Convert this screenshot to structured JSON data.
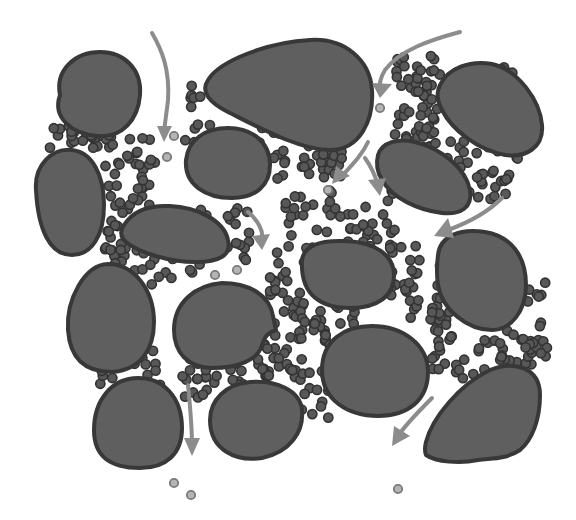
{
  "diagram": {
    "colors": {
      "background": "#ffffff",
      "grain_fill": "#5f5f5f",
      "grain_stroke": "#383838",
      "clay_fill": "#585858",
      "clay_stroke": "#333333",
      "fine_fill": "#b4b4b4",
      "fine_stroke": "#7a7a7a",
      "arrow": "#8c8c8c"
    },
    "grains": [
      {
        "d": "M60 95 C55 70 75 52 100 52 C125 52 142 70 140 95 C138 120 122 138 98 136 C72 134 52 118 60 95 Z"
      },
      {
        "d": "M208 80 C220 60 270 42 310 40 C345 38 370 60 372 90 C374 120 360 150 330 150 C300 150 260 128 228 112 C210 103 200 92 208 80 Z"
      },
      {
        "d": "M440 85 C448 68 470 60 492 64 C518 70 540 100 542 125 C544 148 525 158 505 155 C478 150 452 130 442 110 C437 100 436 93 440 85 Z"
      },
      {
        "d": "M186 160 C188 140 205 128 228 128 C252 128 270 142 270 165 C270 185 256 198 232 198 C206 198 184 185 186 160 Z"
      },
      {
        "d": "M378 155 C382 142 398 138 415 142 C440 148 466 168 470 190 C473 208 460 215 442 213 C418 210 392 198 382 180 C377 172 376 163 378 155 Z"
      },
      {
        "d": "M36 190 C34 165 52 148 72 150 C92 152 104 175 104 205 C104 235 92 255 72 255 C50 255 38 230 36 190 Z"
      },
      {
        "d": "M124 225 C132 212 148 205 170 206 C196 207 224 220 228 240 C232 256 218 262 196 262 C168 262 138 252 126 242 C120 237 120 230 124 225 Z"
      },
      {
        "d": "M302 260 C304 245 320 240 345 241 C375 242 394 255 394 275 C394 296 378 308 350 308 C322 308 300 296 302 260 Z"
      },
      {
        "d": "M438 255 C440 236 460 228 485 232 C510 236 526 255 526 285 C526 312 510 330 492 330 C468 330 442 310 438 285 C436 272 437 263 438 255 Z"
      },
      {
        "d": "M68 330 C66 300 84 265 108 264 C134 264 154 290 154 322 C154 350 140 370 112 372 C84 372 70 358 68 330 Z"
      },
      {
        "d": "M174 330 C174 302 196 285 222 283 C250 283 270 296 273 316 L276 330 C268 332 264 338 262 345 C258 360 238 368 212 368 C188 368 174 352 174 330 Z"
      },
      {
        "d": "M322 370 C322 340 345 326 372 326 C402 326 428 344 428 372 C428 400 408 416 378 416 C348 416 322 400 322 370 Z"
      },
      {
        "d": "M94 430 C94 400 112 378 138 378 C164 378 182 398 182 428 C182 454 166 468 140 468 C112 468 94 458 94 430 Z"
      },
      {
        "d": "M210 420 C210 400 226 384 250 382 C276 380 300 390 302 410 C304 432 290 452 262 458 C236 462 210 450 210 420 Z"
      },
      {
        "d": "M426 442 C432 418 460 384 490 370 C515 360 540 368 540 395 C540 420 532 440 520 450 C505 460 490 458 478 460 C460 464 436 462 426 455 C424 450 425 446 426 442 Z"
      }
    ],
    "arrows": [
      {
        "d": "M152 33 C162 50 170 70 168 100 C166 118 164 128 164 135",
        "head": "157,126 164,142 172,126"
      },
      {
        "d": "M460 32 C430 40 400 50 385 70 C380 78 379 86 380 92",
        "head": "372,83 380,98 392,84"
      },
      {
        "d": "M368 142 C362 155 352 165 340 178",
        "head": "336,166 332,184 350,176"
      },
      {
        "d": "M365 158 C370 165 375 175 378 185",
        "head": "368,180 380,196 386,178"
      },
      {
        "d": "M502 198 C490 210 470 222 448 230",
        "head": "448,218 434,236 454,238"
      },
      {
        "d": "M248 212 C258 220 264 232 262 240",
        "head": "252,236 262,250 270,234"
      },
      {
        "d": "M188 385 C190 405 192 425 192 446",
        "head": "184,438 192,456 200,438"
      },
      {
        "d": "M432 398 C420 410 406 424 398 436",
        "head": "394,426 392,446 410,436"
      }
    ],
    "fines": [
      {
        "cx": 174,
        "cy": 136
      },
      {
        "cx": 167,
        "cy": 157
      },
      {
        "cx": 380,
        "cy": 108
      },
      {
        "cx": 328,
        "cy": 190
      },
      {
        "cx": 215,
        "cy": 275
      },
      {
        "cx": 237,
        "cy": 270
      },
      {
        "cx": 174,
        "cy": 483
      },
      {
        "cx": 191,
        "cy": 495
      },
      {
        "cx": 398,
        "cy": 489
      }
    ]
  }
}
